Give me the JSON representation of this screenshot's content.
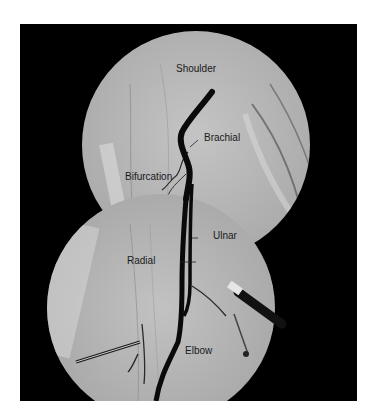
{
  "figure": {
    "background": "#000000",
    "field_color": "#b9b9b9",
    "vessel_color": "#0a0a0a",
    "label_color": "#1a1a1a"
  },
  "labels": {
    "shoulder": "Shoulder",
    "brachial": "Brachial",
    "bifurcation": "Bifurcation",
    "ulnar": "Ulnar",
    "radial": "Radial",
    "elbow": "Elbow"
  }
}
